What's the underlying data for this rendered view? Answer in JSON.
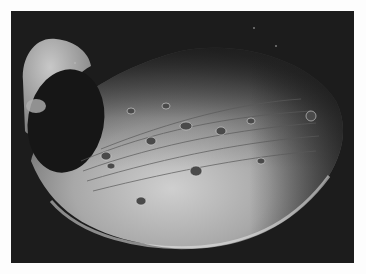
{
  "image": {
    "subject": "Grayscale spacecraft photograph of an irregular cratered moon (Phobos) against black space",
    "background_color": "#1c1c1c",
    "border_color": "#fdfdfd",
    "features": [
      "large dark crater on left lobe",
      "parallel grooves across surface",
      "small craters",
      "bright lit limb along lower edge",
      "few faint stars"
    ]
  }
}
